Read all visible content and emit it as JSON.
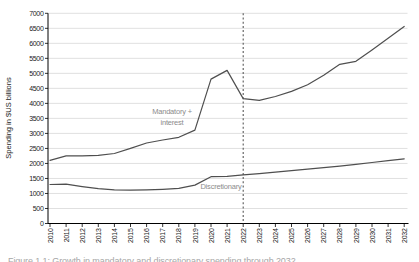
{
  "figure": {
    "caption_truncated": "Figure 1.1: Growth in mandatory and discretionary spending through 2032"
  },
  "chart_data": {
    "type": "line",
    "title": "",
    "xlabel": "",
    "ylabel": "Spending in $US billions",
    "ylim": [
      0,
      7000
    ],
    "ytick_step": 500,
    "grid": "horizontal",
    "legend": "none (inline series labels)",
    "x": [
      2010,
      2011,
      2012,
      2013,
      2014,
      2015,
      2016,
      2017,
      2018,
      2019,
      2020,
      2021,
      2022,
      2023,
      2024,
      2025,
      2026,
      2027,
      2028,
      2029,
      2030,
      2031,
      2032
    ],
    "series": [
      {
        "name": "Mandatory + interest",
        "values": [
          2100,
          2250,
          2250,
          2270,
          2330,
          2500,
          2680,
          2780,
          2870,
          3110,
          4810,
          5100,
          4160,
          4100,
          4230,
          4400,
          4620,
          4940,
          5300,
          5400,
          5780,
          6170,
          6560
        ]
      },
      {
        "name": "Discretionary",
        "values": [
          1300,
          1310,
          1230,
          1160,
          1120,
          1110,
          1120,
          1140,
          1170,
          1280,
          1560,
          1570,
          1620,
          1660,
          1710,
          1760,
          1810,
          1860,
          1910,
          1970,
          2030,
          2090,
          2150
        ]
      }
    ],
    "vline": {
      "x": 2022,
      "style": "dashed",
      "meaning": "projection divider"
    },
    "annotations": [
      {
        "lines": [
          "Mandatory +",
          "interest"
        ]
      },
      {
        "lines": [
          "Discretionary"
        ]
      }
    ]
  },
  "colors": {
    "series_line": "#4f4f4f",
    "grid_line": "#dcdcdc",
    "axis_line": "#000000",
    "dashed_line": "#5a5a5a",
    "annotation_text": "#8c8c8c",
    "tick_text": "#1a1a1a"
  }
}
